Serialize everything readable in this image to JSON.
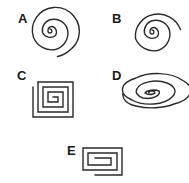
{
  "figures": [
    {
      "id": "A",
      "label": "A",
      "shape": "circular spiral, loose outer turn"
    },
    {
      "id": "B",
      "label": "B",
      "shape": "circular spiral"
    },
    {
      "id": "C",
      "label": "C",
      "shape": "square spiral"
    },
    {
      "id": "D",
      "label": "D",
      "shape": "elliptical spiral"
    },
    {
      "id": "E",
      "label": "E",
      "shape": "rectangular spiral"
    }
  ],
  "colors": {
    "stroke": "#2a2a2a",
    "background": "#ffffff"
  }
}
